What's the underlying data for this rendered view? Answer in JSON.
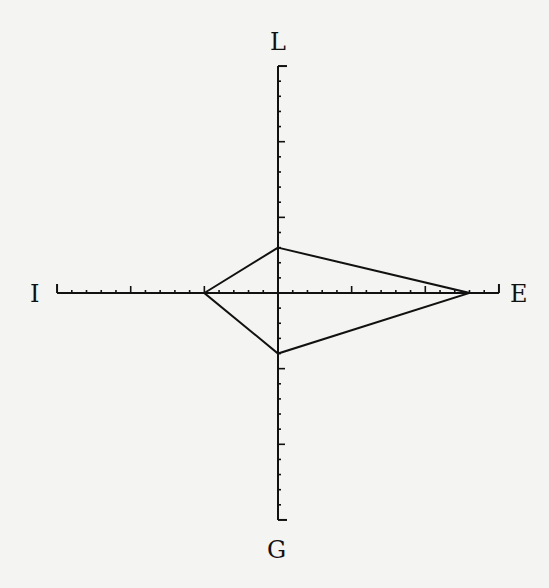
{
  "diagram": {
    "type": "four-axis kite profile",
    "axes": {
      "top": {
        "label": "L",
        "value": 3
      },
      "left": {
        "label": "I",
        "value": 5
      },
      "right": {
        "label": "E",
        "value": 13
      },
      "bottom": {
        "label": "G",
        "value": 4
      }
    },
    "scale_max": 15,
    "minor_tick_step": 1,
    "major_tick_step": 5,
    "line_color": "#111111",
    "background": "#f4f4f2"
  }
}
